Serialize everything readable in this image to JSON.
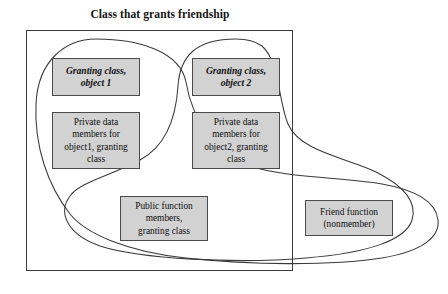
{
  "diagram": {
    "title": "Class that grants friendship",
    "type": "friendship-venn-diagram",
    "colors": {
      "box_fill": "#d2d2d2",
      "box_border": "#4a4a4a",
      "line": "#3a3a3a",
      "background": "#ffffff",
      "text": "#101010"
    },
    "outer_boundary": {
      "name": "class-boundary-rectangle",
      "label_ref": "diagram.title"
    },
    "nodes": [
      {
        "id": "granting-class-object-1",
        "text": "Granting class,\nobject 1",
        "line1": "Granting class,",
        "line2": "object 1",
        "emphasis": "bold-italic"
      },
      {
        "id": "granting-class-object-2",
        "text": "Granting class,\nobject 2",
        "line1": "Granting class,",
        "line2": "object 2",
        "emphasis": "bold-italic"
      },
      {
        "id": "private-data-object-1",
        "line1": "Private data",
        "line2": "members for",
        "line3": "object1, granting",
        "line4": "class",
        "emphasis": "normal"
      },
      {
        "id": "private-data-object-2",
        "line1": "Private data",
        "line2": "members for",
        "line3": "object2, granting",
        "line4": "class",
        "emphasis": "normal"
      },
      {
        "id": "public-function-members",
        "line1": "Public function",
        "line2": "members,",
        "line3": "granting class",
        "emphasis": "normal"
      },
      {
        "id": "friend-function",
        "line1": "Friend function",
        "line2": "(nonmember)",
        "emphasis": "normal"
      }
    ],
    "loops": [
      {
        "id": "friendship-loop-object-1",
        "encloses": [
          "granting-class-object-1",
          "private-data-object-1",
          "public-function-members",
          "friend-function"
        ]
      },
      {
        "id": "friendship-loop-object-2",
        "encloses": [
          "granting-class-object-2",
          "private-data-object-2",
          "public-function-members",
          "friend-function"
        ]
      }
    ]
  }
}
